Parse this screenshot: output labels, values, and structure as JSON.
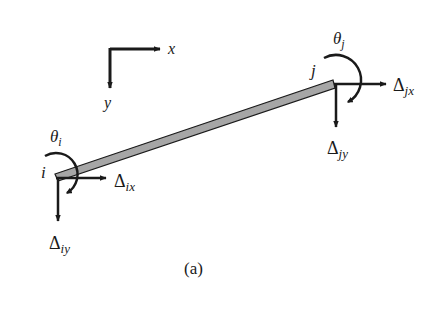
{
  "figure": {
    "caption": "(a)",
    "axes": {
      "x_label": "x",
      "y_label": "y"
    },
    "member": {
      "color": "#a6a6a6",
      "outline": "#1a1a1a"
    },
    "nodes": {
      "i": {
        "label": "i",
        "rotation": {
          "symbol": "θ",
          "sub": "i"
        },
        "dx": {
          "symbol": "Δ",
          "sub": "ix"
        },
        "dy": {
          "symbol": "Δ",
          "sub": "iy"
        }
      },
      "j": {
        "label": "j",
        "rotation": {
          "symbol": "θ",
          "sub": "j"
        },
        "dx": {
          "symbol": "Δ",
          "sub": "jx"
        },
        "dy": {
          "symbol": "Δ",
          "sub": "jy"
        }
      }
    }
  }
}
